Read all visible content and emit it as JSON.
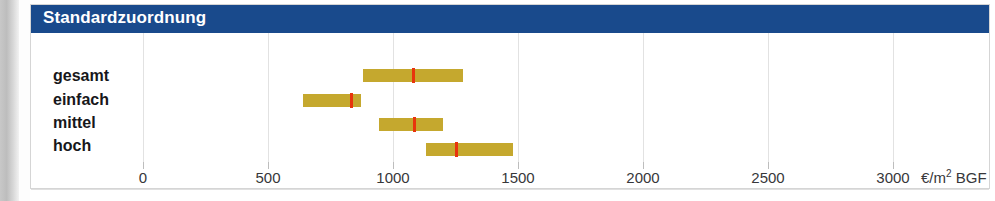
{
  "header": {
    "title": "Standardzuordnung",
    "bar_color": "#194a8c",
    "title_color": "#ffffff"
  },
  "chart_data": {
    "type": "bar",
    "subtype": "floating-range-bar",
    "title": "Standardzuordnung",
    "xlabel": "€/m² BGF",
    "ylabel": "",
    "categories": [
      "gesamt",
      "einfach",
      "mittel",
      "hoch"
    ],
    "xlim": [
      0,
      3250
    ],
    "xticks": [
      0,
      500,
      1000,
      1500,
      2000,
      2500,
      3000
    ],
    "xticklabels": [
      "0",
      "500",
      "1000",
      "1500",
      "2000",
      "2500",
      "3000"
    ],
    "grid": true,
    "grid_axis": "x",
    "legend": false,
    "unit": "€/m² BGF",
    "unit_currency": "€",
    "unit_area": "m",
    "unit_exponent": "2",
    "unit_suffix": "BGF",
    "series": [
      {
        "name": "Spannweite",
        "bar_color": "#c5a82e",
        "marker_name": "Mittelwert",
        "marker_color": "#e8340c",
        "data": [
          {
            "category": "gesamt",
            "low": 880,
            "high": 1280,
            "marker": 1080
          },
          {
            "category": "einfach",
            "low": 640,
            "high": 870,
            "marker": 830
          },
          {
            "category": "mittel",
            "low": 945,
            "high": 1200,
            "marker": 1085
          },
          {
            "category": "hoch",
            "low": 1130,
            "high": 1480,
            "marker": 1250
          }
        ]
      }
    ]
  }
}
